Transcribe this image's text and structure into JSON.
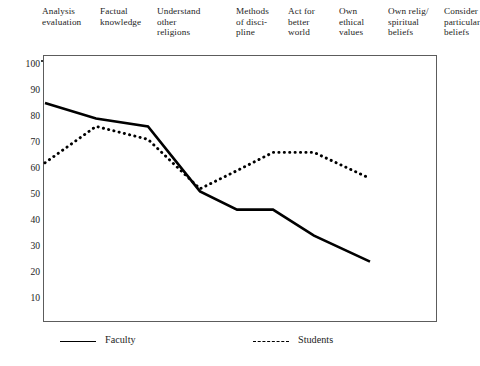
{
  "chart_data": {
    "type": "line",
    "title": "",
    "subtitle": "",
    "xlabel": "",
    "ylabel": "",
    "grid": false,
    "legend_position": "bottom",
    "ylim": [
      0,
      100
    ],
    "yticks": [
      100,
      90,
      80,
      70,
      60,
      50,
      40,
      30,
      20,
      10
    ],
    "ytick_labels": [
      "100",
      "90",
      "80",
      "70",
      "60",
      "50",
      "40",
      "30",
      "20",
      "10"
    ],
    "categories": [
      "Analysis evaluation",
      "Factual knowledge",
      "Understand other religions",
      "Methods of disci-pline",
      "Act for better world",
      "Own ethical values",
      "Own relig/ spiritual beliefs",
      "Consider particular beliefs"
    ],
    "category_lines": [
      [
        "Analysis",
        "evaluation"
      ],
      [
        "Factual",
        "knowledge"
      ],
      [
        "Understand",
        "other",
        "religions"
      ],
      [
        "Methods",
        "of disci-",
        "pline"
      ],
      [
        "Act for",
        "better",
        "world"
      ],
      [
        "Own",
        "ethical",
        "values"
      ],
      [
        "Own relig/",
        "spiritual",
        "beliefs"
      ],
      [
        "Consider",
        "particular",
        "beliefs"
      ]
    ],
    "series": [
      {
        "name": "Faculty",
        "style": "solid",
        "color": "#000000",
        "values": [
          85,
          79,
          76,
          51,
          44,
          44,
          34,
          24
        ]
      },
      {
        "name": "Students",
        "style": "dotted",
        "color": "#000000",
        "values": [
          62,
          76,
          71,
          52,
          59,
          66,
          66,
          56
        ]
      }
    ]
  },
  "legend": {
    "faculty_label": "Faculty",
    "students_label": "Students"
  }
}
